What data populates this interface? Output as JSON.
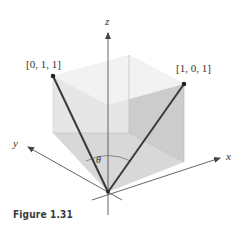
{
  "figure": {
    "caption": "Figure 1.31",
    "axes": {
      "x_label": "x",
      "y_label": "y",
      "z_label": "z"
    },
    "vectors": [
      {
        "label": "[0, 1, 1]",
        "components": [
          0,
          1,
          1
        ]
      },
      {
        "label": "[1, 0, 1]",
        "components": [
          1,
          0,
          1
        ]
      }
    ],
    "angle_label": "θ",
    "shape": "unit cube",
    "colors": {
      "vector": "#3a3a3a",
      "axis": "#555555",
      "top_face": "#f1f1f1",
      "left_face": "#e4e4e4",
      "right_face": "#cfcfcf",
      "floor": "#dcdcdc"
    }
  }
}
